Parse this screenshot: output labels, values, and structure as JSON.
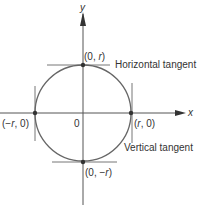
{
  "diagram": {
    "type": "circle-tangents",
    "axes": {
      "x_label": "x",
      "y_label": "y",
      "origin_label": "0"
    },
    "points": [
      {
        "name": "top",
        "label_pre": "(0, ",
        "label_var": "r",
        "label_post": ")"
      },
      {
        "name": "bottom",
        "label_pre": "(0, −",
        "label_var": "r",
        "label_post": ")"
      },
      {
        "name": "left",
        "label_pre": "(−",
        "label_var": "r",
        "label_post": ", 0)"
      },
      {
        "name": "right",
        "label_pre": "(",
        "label_var": "r",
        "label_post": ", 0)"
      }
    ],
    "annotations": {
      "horizontal": "Horizontal tangent",
      "vertical": "Vertical tangent"
    },
    "colors": {
      "line": "#555555",
      "circle": "#666666",
      "point": "#333333",
      "text": "#333333"
    }
  }
}
